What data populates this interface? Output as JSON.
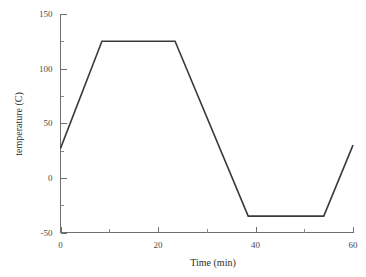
{
  "chart_data": {
    "type": "line",
    "title": "",
    "xlabel": "Time (min)",
    "ylabel": "temperature (C)",
    "xlim": [
      0,
      60
    ],
    "ylim": [
      -50,
      150
    ],
    "xticks": [
      0,
      20,
      40,
      60
    ],
    "xticklabels": [
      "0",
      "20",
      "40",
      "60"
    ],
    "xminorticks": [
      10,
      30,
      50
    ],
    "yticks": [
      -50,
      0,
      50,
      100,
      150
    ],
    "yticklabels": [
      "-50",
      "0",
      "50",
      "100",
      "150"
    ],
    "yminorticks": [
      -25,
      25,
      75,
      125
    ],
    "grid": false,
    "legend": false,
    "series": [
      {
        "name": "temperature program",
        "x": [
          0,
          8.5,
          23.5,
          38.5,
          54,
          60
        ],
        "y": [
          27,
          125,
          125,
          -35,
          -35,
          30
        ]
      }
    ],
    "annotations": []
  },
  "axes": {
    "y_title": "temperature (C)",
    "x_title": "Time (min)"
  },
  "colors": {
    "line": "#3a3a3a",
    "axis": "#6f6f6f",
    "text": "#2b2b2b",
    "ticklabel": "#4a4a4a",
    "background": "#ffffff"
  }
}
